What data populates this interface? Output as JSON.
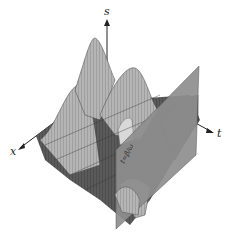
{
  "figure": {
    "axes": {
      "vertical": "s",
      "left": "x",
      "right": "t"
    },
    "plane_label": "t=β/ω",
    "colors": {
      "surface_light": "#b8b8b8",
      "surface_dark": "#4a4a4a",
      "plane": "#8e8e8e",
      "axis": "#222222",
      "background": "#ffffff"
    }
  }
}
